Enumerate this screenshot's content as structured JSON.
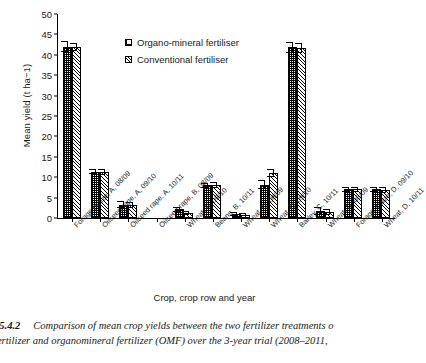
{
  "chart_data": {
    "type": "bar",
    "title": "",
    "xlabel": "Crop, crop row and year",
    "ylabel": "Mean yield (t ha−1)",
    "ylim": [
      0,
      50
    ],
    "yticks": [
      0,
      5,
      10,
      15,
      20,
      25,
      30,
      35,
      40,
      45,
      50
    ],
    "grid": false,
    "legend_position": "upper-center-inside",
    "categories": [
      "Forage maize, A, 08/09",
      "Oilseed rape, A, 09/10",
      "Oilseed rape, A, 10/11",
      "Oilseed rape, B, 08/09",
      "Wheat, B, 09/10",
      "Beans, B, 10/11",
      "Wheat, C, 08/09",
      "Wheat, C, 09/10",
      "Barley, C, 10/11",
      "Wheat, D, 08/09",
      "Forage maize, D, 09/10",
      "Wheat, D, 10/11"
    ],
    "series": [
      {
        "name": "Organo-mineral fertiliser",
        "pattern": "cross-hatch",
        "values": [
          42.0,
          11.4,
          3.3,
          0.0,
          2.1,
          8.0,
          1.0,
          8.2,
          41.8,
          1.8,
          7.0,
          7.0
        ],
        "errors": [
          1.3,
          0.6,
          0.9,
          0.0,
          0.7,
          0.7,
          0.4,
          1.0,
          1.3,
          1.0,
          0.7,
          0.7
        ]
      },
      {
        "name": "Conventional fertiliser",
        "pattern": "diagonal-hatch",
        "values": [
          42.0,
          11.3,
          3.2,
          0.0,
          1.2,
          8.1,
          0.8,
          11.0,
          41.6,
          1.5,
          7.0,
          6.9
        ],
        "errors": [
          1.0,
          0.7,
          0.7,
          0.0,
          0.5,
          0.8,
          0.4,
          1.0,
          1.2,
          0.7,
          0.7,
          0.7
        ]
      }
    ]
  },
  "axes": {
    "ylabel": "Mean yield (t ha−1)",
    "xlabel": "Crop, crop row and year",
    "yticks": [
      "50",
      "45",
      "40",
      "35",
      "30",
      "25",
      "20",
      "15",
      "10",
      "5",
      "0"
    ],
    "xticks": [
      "Forage maize, A, 08/09",
      "Oilseed rape, A, 09/10",
      "Oilseed rape, A, 10/11",
      "Oilseed rape, B, 08/09",
      "Wheat, B, 09/10",
      "Beans, B, 10/11",
      "Wheat, C, 08/09",
      "Wheat, C, 09/10",
      "Barley, C, 10/11",
      "Wheat, D, 08/09",
      "Forage maize, D, 09/10",
      "Wheat, D, 10/11"
    ]
  },
  "legend": {
    "items": [
      {
        "label": "Organo-mineral fertiliser",
        "pattern": "cross-hatch"
      },
      {
        "label": "Conventional fertiliser",
        "pattern": "diagonal-hatch"
      }
    ]
  },
  "caption": {
    "figure_number": "e 5.4.2",
    "line1": "Comparison of mean crop yields between the two fertilizer treatments o",
    "line2": "nal fertilizer and organomineral fertilizer (OMF) over the 3-year trial (2008–2011,"
  }
}
